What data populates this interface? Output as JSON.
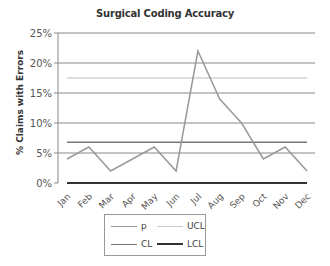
{
  "chart_data": {
    "type": "line",
    "title": "Surgical Coding Accuracy",
    "xlabel": "",
    "ylabel": "% Claims with Errors",
    "categories": [
      "Jan",
      "Feb",
      "Mar",
      "Apr",
      "May",
      "Jun",
      "Jul",
      "Aug",
      "Sep",
      "Oct",
      "Nov",
      "Dec"
    ],
    "series": [
      {
        "name": "p",
        "color": "#999999",
        "values": [
          4,
          6,
          2,
          4,
          6,
          2,
          22,
          14,
          10,
          4,
          6,
          2
        ]
      },
      {
        "name": "UCL",
        "color": "#bbbbbb",
        "values": [
          17.5,
          17.5,
          17.5,
          17.5,
          17.5,
          17.5,
          17.5,
          17.5,
          17.5,
          17.5,
          17.5,
          17.5
        ]
      },
      {
        "name": "CL",
        "color": "#777777",
        "values": [
          6.8,
          6.8,
          6.8,
          6.8,
          6.8,
          6.8,
          6.8,
          6.8,
          6.8,
          6.8,
          6.8,
          6.8
        ]
      },
      {
        "name": "LCL",
        "color": "#333333",
        "values": [
          0,
          0,
          0,
          0,
          0,
          0,
          0,
          0,
          0,
          0,
          0,
          0
        ]
      }
    ],
    "yticks": [
      "0%",
      "5%",
      "10%",
      "15%",
      "20%",
      "25%"
    ],
    "ylim": [
      0,
      25
    ],
    "grid": true,
    "legend_position": "bottom"
  },
  "legend": [
    {
      "label": "p"
    },
    {
      "label": "UCL"
    },
    {
      "label": "CL"
    },
    {
      "label": "LCL"
    }
  ]
}
